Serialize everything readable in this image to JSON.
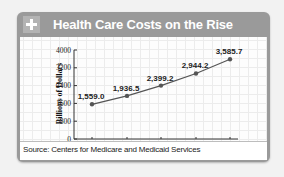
{
  "header": {
    "title": "Health Care Costs on the Rise",
    "icon": "plus-icon"
  },
  "source": "Source: Centers for Medicare and Medicaid Services",
  "colors": {
    "header_bg": "#9a9a9a",
    "plus_box": "#b3b3b3",
    "line": "#555555",
    "marker": "#555555",
    "axis": "#333333"
  },
  "chart_data": {
    "type": "line",
    "title": "Health Care Costs on the Rise",
    "xlabel": "",
    "ylabel": "Billions of Dollars",
    "categories": [
      "2002",
      "2005",
      "2008",
      "2011",
      "2014"
    ],
    "values": [
      1559.0,
      1936.5,
      2399.2,
      2944.2,
      3585.7
    ],
    "data_labels": [
      "1,559.0",
      "1,936.5",
      "2,399.2",
      "2,944.2",
      "3,585.7"
    ],
    "yticks": [
      "0",
      "800",
      "1600",
      "2400",
      "3200",
      "4000"
    ],
    "ylim": [
      0,
      4000
    ],
    "grid": false,
    "legend": null,
    "source": "Source: Centers for Medicare and Medicaid Services"
  }
}
